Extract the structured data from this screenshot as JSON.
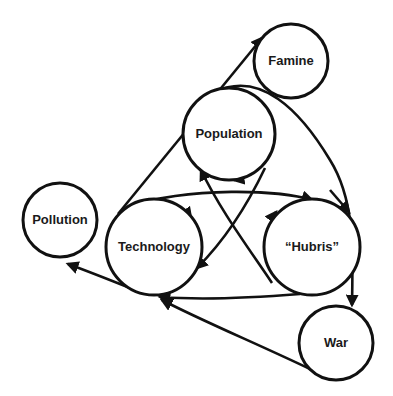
{
  "diagram": {
    "type": "causal-loop",
    "nodes": {
      "famine": {
        "label": "Famine"
      },
      "population": {
        "label": "Population"
      },
      "pollution": {
        "label": "Pollution"
      },
      "technology": {
        "label": "Technology"
      },
      "hubris": {
        "label": "“Hubris”"
      },
      "war": {
        "label": "War"
      }
    },
    "edges": [
      {
        "from": "Technology",
        "to": "Famine"
      },
      {
        "from": "Technology",
        "to": "Population"
      },
      {
        "from": "Population",
        "to": "Technology"
      },
      {
        "from": "Population",
        "to": "“Hubris”"
      },
      {
        "from": "Technology",
        "to": "“Hubris”"
      },
      {
        "from": "“Hubris”",
        "to": "Technology"
      },
      {
        "from": "Population",
        "to": "War"
      },
      {
        "from": "War",
        "to": "Technology"
      },
      {
        "from": "Technology",
        "to": "Pollution"
      }
    ],
    "colors": {
      "stroke": "#111111",
      "background": "#ffffff",
      "text": "#1a1a1a"
    }
  }
}
